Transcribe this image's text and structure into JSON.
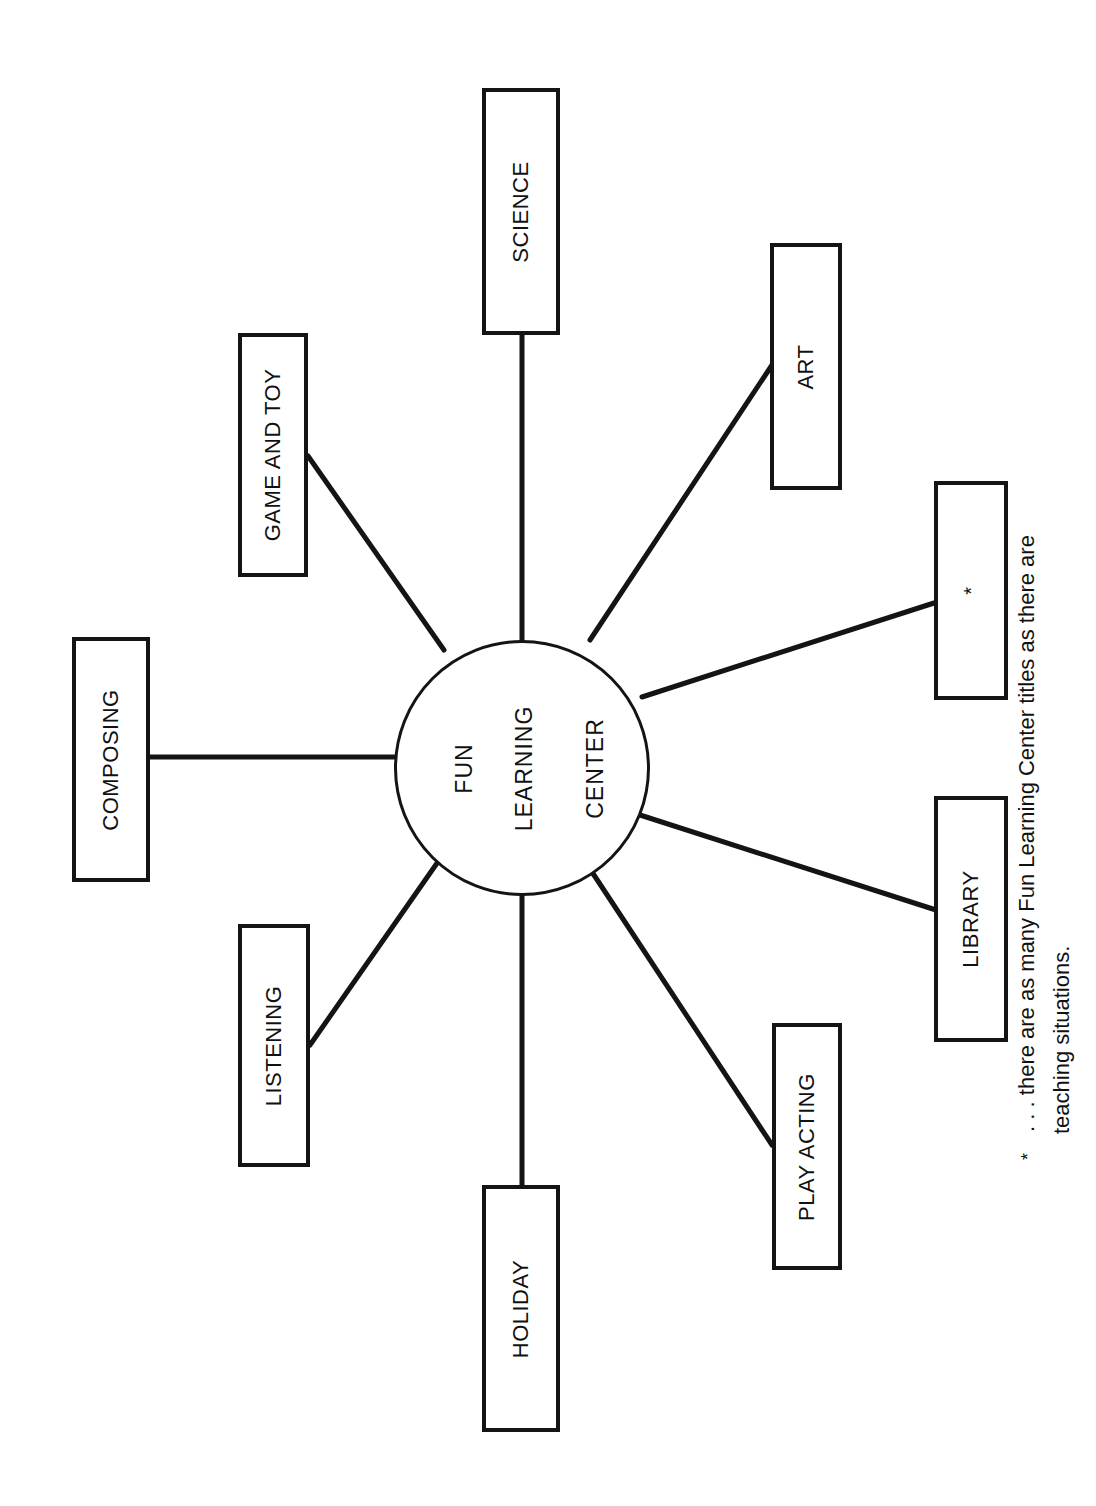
{
  "hub": {
    "lines": [
      "FUN",
      "LEARNING",
      "CENTER"
    ]
  },
  "centers": [
    {
      "id": "science",
      "label": "SCIENCE"
    },
    {
      "id": "art",
      "label": "ART"
    },
    {
      "id": "custom",
      "label": "*"
    },
    {
      "id": "library",
      "label": "LIBRARY"
    },
    {
      "id": "play-acting",
      "label": "PLAY ACTING"
    },
    {
      "id": "holiday",
      "label": "HOLIDAY"
    },
    {
      "id": "listening",
      "label": "LISTENING"
    },
    {
      "id": "composing",
      "label": "COMPOSING"
    },
    {
      "id": "game-and-toy",
      "label": "GAME AND TOY"
    }
  ],
  "footnote": {
    "marker": "*",
    "line1": ". . . there are as many Fun Learning Center titles as there are",
    "line2": "teaching situations."
  },
  "colors": {
    "ink": "#141414",
    "paper": "#ffffff"
  }
}
